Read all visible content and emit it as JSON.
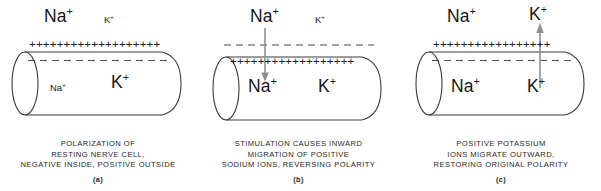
{
  "figure": {
    "background_color": "#ffffff",
    "ink_color": "#1a1a1a",
    "arrow_color": "#8a8a8a",
    "membrane_dash_color": "#4a4a4a"
  },
  "panels": [
    {
      "id": "a",
      "letter": "(a)",
      "outside_labels": {
        "sodium": "Na",
        "sodium_charge": "+",
        "potassium": "K",
        "potassium_charge": "+"
      },
      "inside_labels": {
        "sodium": "Na",
        "sodium_charge": "+",
        "potassium": "K",
        "potassium_charge": "+"
      },
      "charge_row": "+++++++++++++++++++",
      "charge_count": 19,
      "charge_position": "outside",
      "dashed_line_position": "inside",
      "arrow": null,
      "caption_lines": [
        "POLARIZATION OF",
        "RESTING NERVE CELL,",
        "NEGATIVE INSIDE, POSITIVE OUTSIDE"
      ]
    },
    {
      "id": "b",
      "letter": "(b)",
      "outside_labels": {
        "sodium": "Na",
        "sodium_charge": "+",
        "potassium": "K",
        "potassium_charge": "+"
      },
      "inside_labels": {
        "sodium": "Na",
        "sodium_charge": "+",
        "potassium": "K",
        "potassium_charge": "+"
      },
      "charge_row": "++++++++++++++++++",
      "charge_count": 18,
      "charge_position": "inside",
      "dashed_line_position": "outside",
      "arrow": {
        "direction": "down",
        "meaning": "sodium-influx-arrow"
      },
      "caption_lines": [
        "STIMULATION CAUSES INWARD",
        "MIGRATION OF POSITIVE",
        "SODIUM IONS, REVERSING POLARITY"
      ]
    },
    {
      "id": "c",
      "letter": "(c)",
      "outside_labels": {
        "sodium": "Na",
        "sodium_charge": "+",
        "potassium": "K",
        "potassium_charge": "+"
      },
      "inside_labels": {
        "sodium": "Na",
        "sodium_charge": "+",
        "potassium": "K",
        "potassium_charge": "+"
      },
      "charge_row": "+++++++++++++++++",
      "charge_count": 17,
      "charge_position": "outside",
      "dashed_line_position": "inside",
      "arrow": {
        "direction": "up",
        "meaning": "potassium-efflux-arrow"
      },
      "caption_lines": [
        "POSITIVE POTASSIUM",
        "IONS MIGRATE OUTWARD,",
        "RESTORING ORIGINAL POLARITY"
      ]
    }
  ]
}
